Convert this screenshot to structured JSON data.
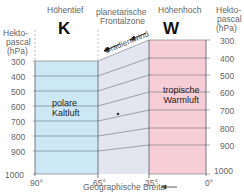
{
  "header": {
    "left_title": "Höhentief",
    "center_title_line1": "planetarische",
    "center_title_line2": "Frontalzone",
    "right_title": "Höhenhoch",
    "left_symbol": "K",
    "right_symbol": "W"
  },
  "axes": {
    "left_unit_line1": "Hekto-",
    "left_unit_line2": "pascal",
    "left_unit_line3": "(hPa)",
    "right_unit_line1": "Hekto-",
    "right_unit_line2": "pascal",
    "right_unit_line3": "(hPa)",
    "pressure_ticks": [
      "300",
      "400",
      "500",
      "600",
      "700",
      "800",
      "900",
      "1000"
    ],
    "latitude_ticks": [
      "90°",
      "65°",
      "35°",
      "0°"
    ],
    "x_label": "Geographische Breite",
    "x_arrow": "←"
  },
  "regions": {
    "left_label_line1": "polare",
    "left_label_line2": "Kaltluft",
    "center_label": "Gradientwind",
    "right_label_line1": "tropische",
    "right_label_line2": "Warmluft"
  },
  "colors": {
    "cold_air": "#cde8f5",
    "frontal_zone": "#e3e6f0",
    "warm_air": "#f7cdd6",
    "grid_line": "#6a7078",
    "border": "#555a60"
  }
}
